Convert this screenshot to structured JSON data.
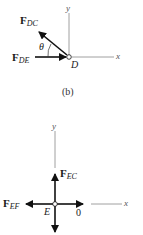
{
  "diagram_b": {
    "caption": "(b)",
    "point": "D",
    "angle": "θ",
    "axes": {
      "x": "x",
      "y": "y"
    },
    "forces": [
      {
        "name": "F",
        "sub": "DC",
        "direction": "up-left"
      },
      {
        "name": "F",
        "sub": "DE",
        "direction": "right (toward D)"
      }
    ]
  },
  "diagram_e": {
    "point": "E",
    "axes": {
      "x": "x",
      "y": "y"
    },
    "zero_label": "0",
    "forces": [
      {
        "name": "F",
        "sub": "EC",
        "direction": "up"
      },
      {
        "name": "F",
        "sub": "EF",
        "direction": "left"
      },
      {
        "name": "",
        "sub": "",
        "direction": "down"
      }
    ]
  }
}
